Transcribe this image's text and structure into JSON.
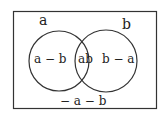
{
  "diagram": {
    "type": "venn",
    "sets": [
      "a",
      "b"
    ],
    "labels": {
      "set_a": "a",
      "set_b": "b",
      "only_a": "a − b",
      "intersection": "ab",
      "only_b": "b − a",
      "outside": "− a − b"
    },
    "colors": {
      "stroke": "#333333",
      "text": "#222222",
      "background": "#ffffff"
    }
  }
}
